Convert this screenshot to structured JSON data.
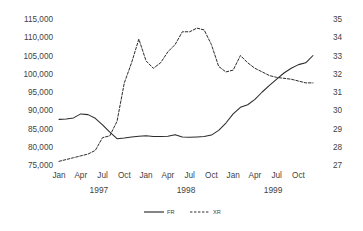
{
  "chart_data": {
    "type": "line",
    "title": "",
    "xlabel": "",
    "ylabel": "",
    "grid": false,
    "legend_position": "bottom-center",
    "x": [
      "Jan 1997",
      "Feb 1997",
      "Mar 1997",
      "Apr 1997",
      "May 1997",
      "Jun 1997",
      "Jul 1997",
      "Aug 1997",
      "Sep 1997",
      "Oct 1997",
      "Nov 1997",
      "Dec 1997",
      "Jan 1998",
      "Feb 1998",
      "Mar 1998",
      "Apr 1998",
      "May 1998",
      "Jun 1998",
      "Jul 1998",
      "Aug 1998",
      "Sep 1998",
      "Oct 1998",
      "Nov 1998",
      "Dec 1998",
      "Jan 1999",
      "Feb 1999",
      "Mar 1999",
      "Apr 1999",
      "May 1999",
      "Jun 1999",
      "Jul 1999",
      "Aug 1999",
      "Sep 1999",
      "Oct 1999",
      "Nov 1999",
      "Dec 1999"
    ],
    "x_tick_labels": [
      "Jan",
      "Apr",
      "Jul",
      "Oct",
      "Jan",
      "Apr",
      "Jul",
      "Oct",
      "Jan",
      "Apr",
      "Jul",
      "Oct"
    ],
    "x_tick_indices": [
      0,
      3,
      6,
      9,
      12,
      15,
      18,
      21,
      24,
      27,
      30,
      33
    ],
    "year_groups": [
      {
        "label": "1997",
        "start_index": 0,
        "end_index": 11
      },
      {
        "label": "1998",
        "start_index": 12,
        "end_index": 23
      },
      {
        "label": "1999",
        "start_index": 24,
        "end_index": 35
      }
    ],
    "left_axis": {
      "name": "FR",
      "ylim": [
        75000,
        115000
      ],
      "tick_step": 5000,
      "tick_labels": [
        "115,000",
        "110,000",
        "105,000",
        "100,000",
        "95,000",
        "90,000",
        "85,000",
        "80,000",
        "75,000"
      ],
      "tick_values": [
        115000,
        110000,
        105000,
        100000,
        95000,
        90000,
        85000,
        80000,
        75000
      ]
    },
    "right_axis": {
      "name": "XR",
      "ylim": [
        27,
        35
      ],
      "tick_step": 1,
      "tick_labels": [
        "35",
        "34",
        "33",
        "32",
        "31",
        "30",
        "29",
        "28",
        "27"
      ],
      "tick_values": [
        35,
        34,
        33,
        32,
        31,
        30,
        29,
        28,
        27
      ]
    },
    "series": [
      {
        "name": "FR",
        "axis": "left",
        "style": "solid",
        "color": "#2b2b2b",
        "values": [
          87500,
          87600,
          87900,
          89000,
          88800,
          87800,
          86000,
          84000,
          82200,
          82400,
          82700,
          82900,
          83000,
          82800,
          82800,
          82900,
          83300,
          82700,
          82600,
          82700,
          82800,
          83200,
          84500,
          86500,
          89000,
          90800,
          91500,
          93000,
          95000,
          96800,
          98500,
          100200,
          101500,
          102500,
          103000,
          105000
        ]
      },
      {
        "name": "XR",
        "axis": "right",
        "style": "dashed",
        "color": "#2b2b2b",
        "values": [
          27.2,
          27.3,
          27.4,
          27.5,
          27.6,
          27.8,
          28.5,
          28.6,
          29.4,
          31.5,
          32.6,
          33.9,
          32.7,
          32.3,
          32.6,
          33.2,
          33.6,
          34.3,
          34.3,
          34.5,
          34.4,
          33.6,
          32.4,
          32.1,
          32.2,
          33.0,
          32.6,
          32.3,
          32.1,
          31.9,
          31.8,
          31.75,
          31.7,
          31.6,
          31.5,
          31.5
        ]
      }
    ],
    "legend": [
      {
        "label": "FR",
        "style": "solid"
      },
      {
        "label": "XR",
        "style": "dashed"
      }
    ]
  }
}
